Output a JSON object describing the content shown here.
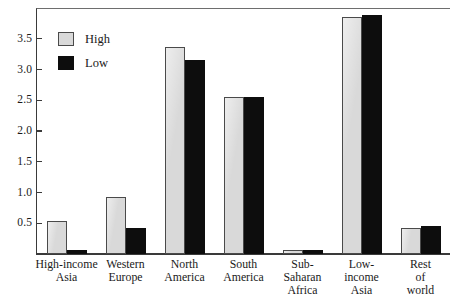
{
  "chart_data": {
    "type": "bar",
    "title": "",
    "subtitle": "",
    "xlabel": "",
    "ylabel": "",
    "grid": false,
    "legend_position": "top-left inside plot",
    "ylim": [
      0,
      4.0
    ],
    "yticks": [
      "0.5",
      "1.0",
      "1.5",
      "2.0",
      "2.5",
      "3.0",
      "3.5"
    ],
    "ytick_values": [
      0.5,
      1.0,
      1.5,
      2.0,
      2.5,
      3.0,
      3.5
    ],
    "categories": [
      "High-income Asia",
      "Western Europe",
      "North America",
      "South America",
      "Sub-Saharan Africa",
      "Low-income Asia",
      "Rest of world"
    ],
    "category_lines": [
      [
        "High-income",
        "Asia"
      ],
      [
        "Western",
        "Europe"
      ],
      [
        "North",
        "America"
      ],
      [
        "South",
        "America"
      ],
      [
        "Sub-",
        "Saharan",
        "Africa"
      ],
      [
        "Low-",
        "income",
        "Asia"
      ],
      [
        "Rest",
        "of",
        "world"
      ]
    ],
    "series": [
      {
        "name": "High",
        "color": "#d9d9d9",
        "values": [
          0.54,
          0.92,
          3.37,
          2.55,
          0.07,
          3.85,
          0.43
        ]
      },
      {
        "name": "Low",
        "color": "#0d0d0d",
        "values": [
          0.06,
          0.42,
          3.15,
          2.55,
          0.07,
          3.89,
          0.45
        ]
      }
    ]
  },
  "legend": {
    "items": [
      {
        "label": "High",
        "swatch": "high"
      },
      {
        "label": "Low",
        "swatch": "low"
      }
    ]
  },
  "colors": {
    "high_fill": "#d9d9d9",
    "low_fill": "#0d0d0d",
    "axis": "#3a3a3a",
    "background": "#ffffff"
  }
}
